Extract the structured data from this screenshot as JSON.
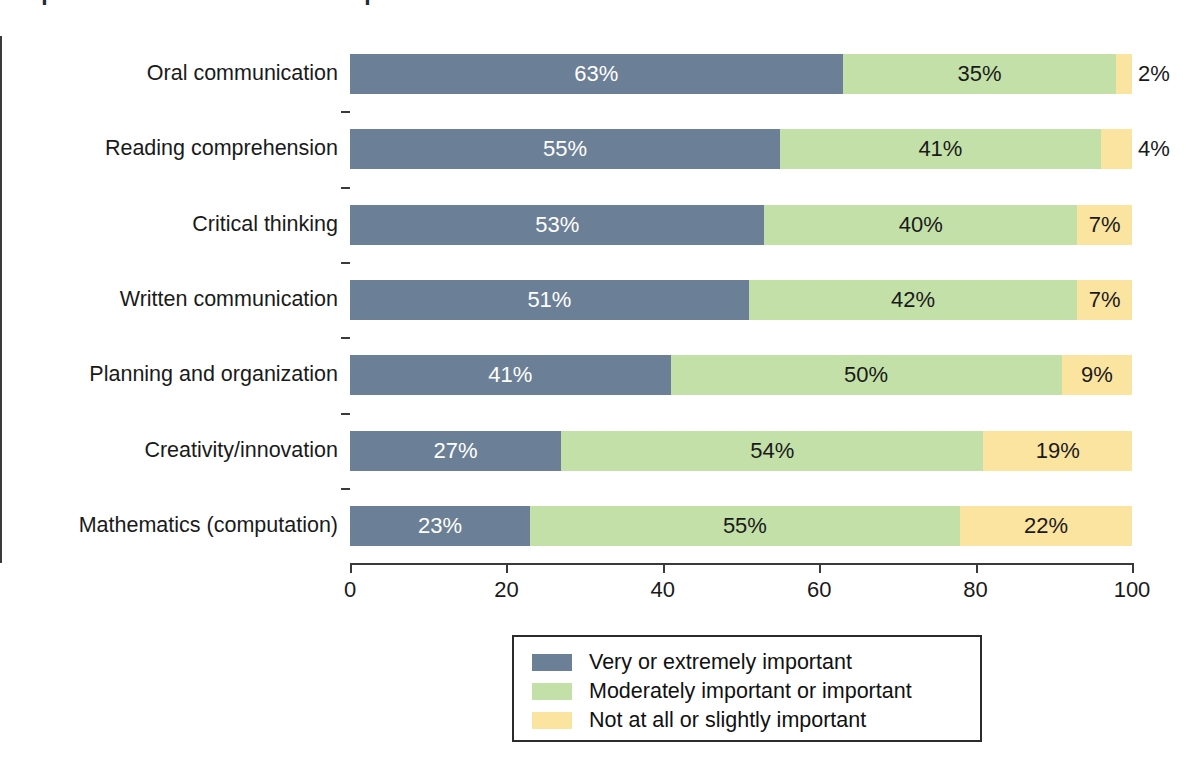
{
  "chart_data": {
    "type": "bar",
    "orientation": "horizontal",
    "stacked": true,
    "normalized_percent": true,
    "title": "Importance of skills in the workplace",
    "title_clipped": true,
    "xlabel": "",
    "ylabel": "",
    "xlim": [
      0,
      100
    ],
    "xticks": [
      0,
      20,
      40,
      60,
      80,
      100
    ],
    "xtick_labels": [
      "0",
      "20",
      "40",
      "60",
      "80",
      "100"
    ],
    "grid": false,
    "legend_position": "bottom-center",
    "categories": [
      "Oral communication",
      "Reading comprehension",
      "Critical thinking",
      "Written communication",
      "Planning and organization",
      "Creativity/innovation",
      "Mathematics (computation)"
    ],
    "series": [
      {
        "name": "Very or extremely important",
        "color": "#6b7f96",
        "values": [
          63,
          55,
          53,
          51,
          41,
          27,
          23
        ],
        "value_labels": [
          "63%",
          "55%",
          "53%",
          "51%",
          "41%",
          "27%",
          "23%"
        ]
      },
      {
        "name": "Moderately important or important",
        "color": "#c3e0a8",
        "values": [
          35,
          41,
          40,
          42,
          50,
          54,
          55
        ],
        "value_labels": [
          "35%",
          "41%",
          "40%",
          "42%",
          "50%",
          "54%",
          "55%"
        ]
      },
      {
        "name": "Not at all or slightly important",
        "color": "#fbe3a0",
        "values": [
          2,
          4,
          7,
          7,
          9,
          19,
          22
        ],
        "value_labels": [
          "2%",
          "4%",
          "7%",
          "7%",
          "9%",
          "19%",
          "22%"
        ]
      }
    ]
  },
  "colors": {
    "series_1": "#6b7f96",
    "series_2": "#c3e0a8",
    "series_3": "#fbe3a0",
    "axis": "#3a3a3a",
    "text": "#1a1a1a",
    "background": "#ffffff"
  }
}
